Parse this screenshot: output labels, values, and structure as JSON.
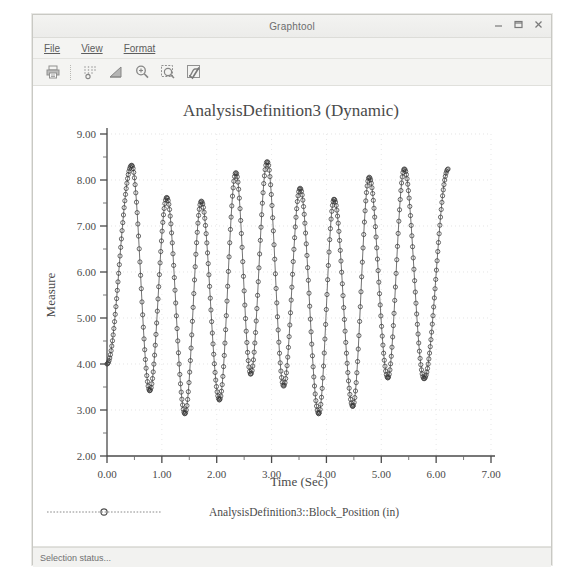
{
  "window": {
    "title": "Graphtool",
    "controls": [
      {
        "name": "minimize-button",
        "glyph": "minimize"
      },
      {
        "name": "maximize-button",
        "glyph": "maximize"
      },
      {
        "name": "close-button",
        "glyph": "close"
      }
    ]
  },
  "menu": {
    "items": [
      {
        "label": "File",
        "accel": "F"
      },
      {
        "label": "View",
        "accel": "V"
      },
      {
        "label": "Format",
        "accel": "o"
      }
    ]
  },
  "toolbar": {
    "buttons": [
      {
        "name": "print-icon",
        "title": "Print"
      },
      {
        "name": "grid-points-icon",
        "title": "Grid / Points"
      },
      {
        "name": "chart-style-icon",
        "title": "Chart Style"
      },
      {
        "name": "zoom-in-icon",
        "title": "Zoom In"
      },
      {
        "name": "zoom-area-icon",
        "title": "Zoom Area"
      },
      {
        "name": "curve-fit-icon",
        "title": "Curve"
      }
    ]
  },
  "status": {
    "text": "Selection status..."
  },
  "chart_data": {
    "type": "line",
    "title": "AnalysisDefinition3 (Dynamic)",
    "xlabel": "Time (Sec)",
    "ylabel": "Measure",
    "xlim": [
      0,
      7
    ],
    "ylim": [
      2,
      9
    ],
    "xticks": [
      "0.00",
      "1.00",
      "2.00",
      "3.00",
      "4.00",
      "5.00",
      "6.00",
      "7.00"
    ],
    "yticks": [
      "2.00",
      "3.00",
      "4.00",
      "5.00",
      "6.00",
      "7.00",
      "8.00",
      "9.00"
    ],
    "xtick_values": [
      0,
      1,
      2,
      3,
      4,
      5,
      6,
      7
    ],
    "ytick_values": [
      2,
      3,
      4,
      5,
      6,
      7,
      8,
      9
    ],
    "grid": true,
    "minor_ticks": true,
    "legend_position": "bottom",
    "marker": "open-circle",
    "line_color": "#3c3c3c",
    "series": [
      {
        "name": "AnalysisDefinition3::Block_Position (in)",
        "units": "in",
        "mean": 5.62,
        "sample_dt": 0.0125,
        "peaks": [
          {
            "t": 0.45,
            "y": 8.32
          },
          {
            "t": 1.09,
            "y": 7.62
          },
          {
            "t": 1.72,
            "y": 7.54
          },
          {
            "t": 2.35,
            "y": 8.16
          },
          {
            "t": 2.92,
            "y": 8.4
          },
          {
            "t": 3.52,
            "y": 7.82
          },
          {
            "t": 4.14,
            "y": 7.58
          },
          {
            "t": 4.78,
            "y": 8.06
          },
          {
            "t": 5.42,
            "y": 8.24
          }
        ],
        "troughs": [
          {
            "t": 0.78,
            "y": 3.42
          },
          {
            "t": 1.42,
            "y": 2.92
          },
          {
            "t": 2.05,
            "y": 3.22
          },
          {
            "t": 2.62,
            "y": 3.78
          },
          {
            "t": 3.22,
            "y": 3.52
          },
          {
            "t": 3.86,
            "y": 2.92
          },
          {
            "t": 4.48,
            "y": 3.08
          },
          {
            "t": 5.12,
            "y": 3.7
          },
          {
            "t": 5.78,
            "y": 3.68
          }
        ],
        "t_start": 0.0,
        "t_end": 6.22,
        "y_start": 4.0
      }
    ]
  }
}
